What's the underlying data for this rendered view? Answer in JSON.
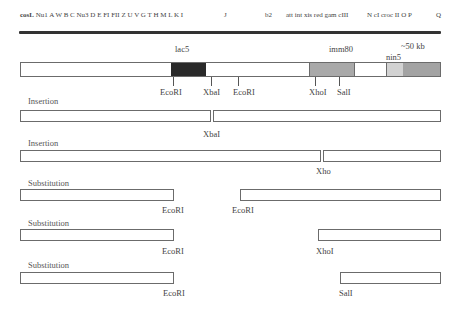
{
  "genetic_map": {
    "cos": "cosL",
    "genes_left": "Nu1 A W B C Nu3 D E FI FII Z U V G T H M L K I",
    "gene_J": "J",
    "gene_b2": "b2",
    "genes_mid": "att int xis red gam cIII",
    "genes_right": "N cI croc II O P",
    "gene_Q": "Q"
  },
  "vector_map": {
    "regions": {
      "lac5": "lac5",
      "imm80": "imm80",
      "nin5": "nin5",
      "size": "~50 kb"
    },
    "sites": [
      "EcoRI",
      "XbaI",
      "EcoRI",
      "XhoI",
      "SalI"
    ],
    "colors": {
      "lac5": "#2a2a2a",
      "imm80": "#a9a9a9",
      "nin5": "#d2d2d2",
      "right_arm": "#a3a3a3",
      "outline": "#6b6b6b"
    }
  },
  "constructs": [
    {
      "type": "Insertion",
      "site": "XbaI"
    },
    {
      "type": "Insertion",
      "site": "Xho"
    },
    {
      "type": "Substitution",
      "left_site": "EcoRI",
      "right_site": "EcoRI"
    },
    {
      "type": "Substitution",
      "left_site": "",
      "right_site": "XhoI"
    },
    {
      "type": "Substitution",
      "left_site": "EcoRI",
      "right_site": "SalI"
    }
  ],
  "construct_left_label_row4": "EcoRI"
}
